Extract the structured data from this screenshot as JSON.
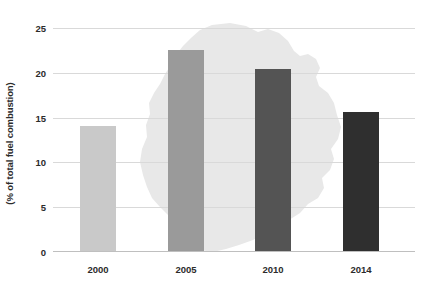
{
  "chart_data": {
    "type": "bar",
    "title": "",
    "subtitle": "",
    "xlabel": "",
    "ylabel": "(% of total fuel combustion)",
    "categories": [
      "2000",
      "2005",
      "2010",
      "2014"
    ],
    "values": [
      14.0,
      22.5,
      20.4,
      15.6
    ],
    "series": [
      {
        "name": "(% of total fuel combustion)",
        "values": [
          14.0,
          22.5,
          20.4,
          15.6
        ]
      }
    ],
    "ylim": [
      0,
      25
    ],
    "yticks": [
      0,
      5,
      10,
      15,
      20,
      25
    ],
    "ytick_labels": [
      "0",
      "5",
      "10",
      "15",
      "20",
      "25"
    ],
    "grid": true,
    "legend": false,
    "legend_position": "none",
    "bar_colors": [
      "#c9c9c9",
      "#9a9a9a",
      "#545454",
      "#2f2f2f"
    ],
    "annotations": [
      {
        "name": "background-watermark",
        "description": "Uruguay country silhouette watermark",
        "color": "#e8e8e8"
      }
    ]
  },
  "colors": {
    "gridline": "#d9d9d9",
    "axis": "#bfbfbf",
    "text": "#2b2b2b",
    "watermark": "#e8e8e8",
    "background": "#ffffff"
  }
}
